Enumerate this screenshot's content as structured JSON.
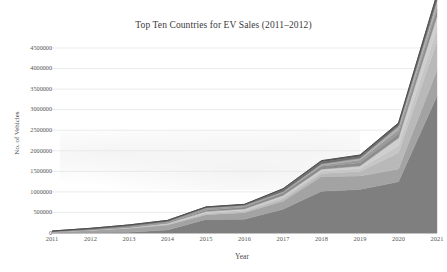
{
  "chart_data": {
    "type": "area",
    "stacked": true,
    "title": "Top Ten Countries for EV Sales (2011–2012)",
    "xlabel": "Year",
    "ylabel": "No. of Vehicles",
    "categories": [
      "2011",
      "2012",
      "2013",
      "2014",
      "2015",
      "2016",
      "2017",
      "2018",
      "2019",
      "2020",
      "2021"
    ],
    "x": [
      2011,
      2012,
      2013,
      2014,
      2015,
      2016,
      2017,
      2018,
      2019,
      2020,
      2021
    ],
    "ylim": [
      0,
      4500000
    ],
    "xlim": [
      2011,
      2021
    ],
    "y_ticks": [
      0,
      500000,
      1000000,
      1500000,
      2000000,
      2500000,
      3000000,
      3500000,
      4000000,
      4500000
    ],
    "y_tick_labels": [
      "0",
      "500000",
      "1000000",
      "1500000",
      "2000000",
      "2500000",
      "3000000",
      "3500000",
      "4000000",
      "4500000"
    ],
    "grid": true,
    "grid_axis": "y",
    "legend": false,
    "legend_position": "none",
    "series": [
      {
        "name": "China",
        "color": "#7f7f7f",
        "values": [
          8000,
          13000,
          18000,
          75000,
          331000,
          336000,
          579000,
          1016000,
          1060000,
          1246000,
          3334000
        ]
      },
      {
        "name": "United States",
        "color": "#a3a3a3",
        "values": [
          18000,
          53000,
          97000,
          119000,
          114000,
          159000,
          195000,
          361000,
          327000,
          308000,
          631000
        ]
      },
      {
        "name": "Germany",
        "color": "#b9b9b9",
        "values": [
          2000,
          3000,
          7000,
          13000,
          24000,
          25000,
          55000,
          68000,
          109000,
          395000,
          695000
        ]
      },
      {
        "name": "United Kingdom",
        "color": "#c6c6c6",
        "values": [
          1000,
          2000,
          4000,
          15000,
          28000,
          38000,
          47000,
          60000,
          72000,
          176000,
          305000
        ]
      },
      {
        "name": "France",
        "color": "#cfcfcf",
        "values": [
          3000,
          6000,
          9000,
          13000,
          23000,
          28000,
          37000,
          46000,
          61000,
          185000,
          310000
        ]
      },
      {
        "name": "Norway",
        "color": "#8c8c8c",
        "values": [
          2000,
          4000,
          8000,
          20000,
          34000,
          45000,
          62000,
          73000,
          80000,
          105000,
          153000
        ]
      },
      {
        "name": "Netherlands",
        "color": "#9a9a9a",
        "values": [
          1000,
          5000,
          22000,
          15000,
          43000,
          25000,
          11000,
          25000,
          67000,
          89000,
          96000
        ]
      },
      {
        "name": "Sweden",
        "color": "#aeaeae",
        "values": [
          200,
          1000,
          1500,
          4600,
          8600,
          13000,
          20000,
          29000,
          41000,
          94000,
          138000
        ]
      },
      {
        "name": "Japan",
        "color": "#6f6f6f",
        "values": [
          13000,
          26000,
          29000,
          31000,
          26000,
          24000,
          56000,
          50000,
          44000,
          31000,
          45000
        ]
      },
      {
        "name": "South Korea",
        "color": "#5d5d5d",
        "values": [
          300,
          700,
          800,
          1300,
          3000,
          5000,
          14000,
          32000,
          35000,
          47000,
          101000
        ]
      }
    ]
  }
}
